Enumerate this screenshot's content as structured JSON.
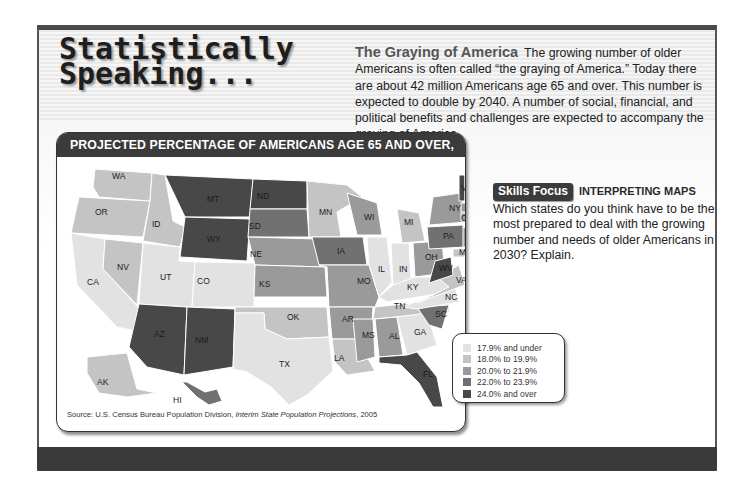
{
  "page": {
    "title_line1": "Statistically",
    "title_line2": "Speaking..."
  },
  "intro": {
    "heading": "The Graying of America",
    "body": "The growing number of older Americans is often called “the graying of America.” Today there are about 42 million Americans age 65 and over. This number is expected to double by 2040. A number of social, financial, and political benefits and challenges are expected to accompany the graying of America."
  },
  "map": {
    "title": "PROJECTED PERCENTAGE OF AMERICANS AGE 65 AND OVER, 2030",
    "source_prefix": "Source: U.S. Census Bureau Population Division, ",
    "source_title": "Interim State Population Projections",
    "source_suffix": ", 2005",
    "legend": [
      {
        "label": "17.9% and under",
        "color": "#e2e2e2"
      },
      {
        "label": "18.0% to 19.9%",
        "color": "#c4c4c4"
      },
      {
        "label": "20.0% to 21.9%",
        "color": "#9a9a9a"
      },
      {
        "label": "22.0% to 23.9%",
        "color": "#717171"
      },
      {
        "label": "24.0% and over",
        "color": "#484848"
      }
    ],
    "states": {
      "WA": 1,
      "OR": 1,
      "CA": 0,
      "NV": 1,
      "ID": 1,
      "MT": 4,
      "WY": 4,
      "UT": 0,
      "CO": 0,
      "AZ": 4,
      "NM": 4,
      "ND": 4,
      "SD": 3,
      "NE": 2,
      "KS": 2,
      "OK": 1,
      "TX": 0,
      "MN": 1,
      "IA": 3,
      "MO": 2,
      "AR": 2,
      "LA": 1,
      "WI": 2,
      "IL": 0,
      "IN": 0,
      "MI": 1,
      "OH": 2,
      "KY": 0,
      "TN": 1,
      "MS": 2,
      "AL": 2,
      "GA": 0,
      "FL": 4,
      "SC": 3,
      "NC": 0,
      "VA": 1,
      "WV": 4,
      "PA": 3,
      "NY": 2,
      "MD": 1,
      "DE": 3,
      "NJ": 2,
      "CT": 2,
      "RI": 2,
      "MA": 2,
      "VT": 4,
      "NH": 3,
      "ME": 4,
      "DC": 0,
      "AK": 1,
      "HI": 3
    }
  },
  "skills_focus": {
    "badge": "Skills Focus",
    "title": "INTERPRETING MAPS",
    "question": "Which states do you think have to be the most prepared to deal with the growing number and needs of older Americans in 2030? Explain."
  }
}
